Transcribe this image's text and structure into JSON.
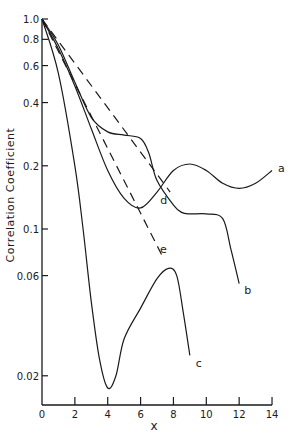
{
  "chart_data": {
    "type": "line",
    "title": "",
    "xlabel": "x",
    "ylabel": "Correlation  Coefficient",
    "xscale": "linear",
    "yscale": "log",
    "xlim": [
      0,
      14
    ],
    "ylim": [
      0.015,
      1.0
    ],
    "x_ticks": [
      0,
      2,
      4,
      6,
      8,
      10,
      12,
      14
    ],
    "y_ticks": [
      1.0,
      0.8,
      0.6,
      0.4,
      0.2,
      0.1,
      0.06,
      0.02
    ],
    "y_tick_labels": [
      "1.0",
      "0.8",
      "0.6",
      "0.4",
      "0.2",
      "0.1",
      "0.06",
      "0.02"
    ],
    "grid": false,
    "legend": "inline labels at curve ends",
    "series": [
      {
        "name": "a",
        "style": "solid",
        "x": [
          0,
          1,
          2,
          3,
          4,
          5,
          6,
          7,
          8,
          9,
          10,
          11,
          12,
          13,
          14
        ],
        "y": [
          1.0,
          0.72,
          0.48,
          0.3,
          0.19,
          0.14,
          0.126,
          0.15,
          0.19,
          0.204,
          0.19,
          0.165,
          0.156,
          0.165,
          0.19
        ]
      },
      {
        "name": "b",
        "style": "solid",
        "x": [
          0,
          1,
          2,
          3,
          4,
          5,
          6,
          6.5,
          7,
          8,
          8.5,
          9,
          10,
          11,
          11.5,
          12
        ],
        "y": [
          1.0,
          0.75,
          0.5,
          0.34,
          0.29,
          0.28,
          0.27,
          0.23,
          0.17,
          0.13,
          0.12,
          0.118,
          0.118,
          0.112,
          0.08,
          0.055
        ]
      },
      {
        "name": "c",
        "style": "solid",
        "x": [
          0,
          1,
          2,
          2.5,
          3,
          3.5,
          4,
          4.5,
          5,
          6,
          7,
          7.7,
          8.2,
          8.6,
          9
        ],
        "y": [
          1.0,
          0.55,
          0.2,
          0.1,
          0.045,
          0.024,
          0.0175,
          0.02,
          0.03,
          0.042,
          0.058,
          0.065,
          0.06,
          0.04,
          0.025
        ]
      },
      {
        "name": "d",
        "style": "dashed",
        "x": [
          0,
          7.8
        ],
        "y": [
          1.0,
          0.15
        ]
      },
      {
        "name": "e",
        "style": "dashed",
        "x": [
          0,
          7.3
        ],
        "y": [
          1.0,
          0.075
        ]
      }
    ]
  }
}
